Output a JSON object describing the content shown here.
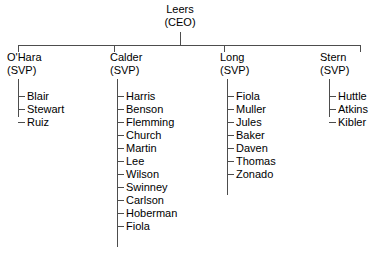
{
  "diagram": {
    "type": "organizational-chart",
    "title_text": "",
    "line_color": "#4d4d4d",
    "text_color": "#000000",
    "background_color": "#ffffff",
    "root": {
      "name": "Leers",
      "title": "(CEO)"
    },
    "divisions": [
      {
        "name": "O'Hara",
        "title": "(SVP)",
        "reports": [
          "Blair",
          "Stewart",
          "Ruiz"
        ]
      },
      {
        "name": "Calder",
        "title": "(SVP)",
        "reports": [
          "Harris",
          "Benson",
          "Flemming",
          "Church",
          "Martin",
          "Lee",
          "Wilson",
          "Swinney",
          "Carlson",
          "Hoberman",
          "Fiola"
        ]
      },
      {
        "name": "Long",
        "title": "(SVP)",
        "reports": [
          "Fiola",
          "Muller",
          "Jules",
          "Baker",
          "Daven",
          "Thomas",
          "Zonado"
        ]
      },
      {
        "name": "Stern",
        "title": "(SVP)",
        "reports": [
          "Huttle",
          "Atkins",
          "Kibler"
        ]
      }
    ]
  }
}
